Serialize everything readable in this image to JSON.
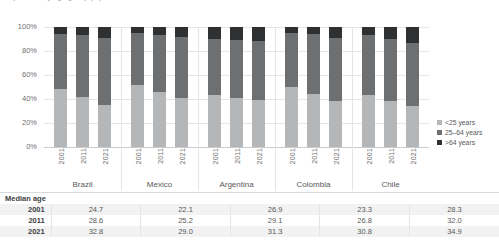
{
  "chart_title": "Population by age group (%)",
  "axis": {
    "y_ticks": [
      "100%",
      "80%",
      "60%",
      "40%",
      "20%",
      "0%"
    ]
  },
  "legend": {
    "items": [
      {
        "label": "<25 years",
        "color": "#b5b6b7",
        "swatch_name": "legend-swatch-under25"
      },
      {
        "label": "25–64 years",
        "color": "#6e6f71",
        "swatch_name": "legend-swatch-25to64"
      },
      {
        "label": ">64 years",
        "color": "#2f3032",
        "swatch_name": "legend-swatch-over64"
      }
    ]
  },
  "countries": [
    {
      "name": "Brazil",
      "years": [
        "2001",
        "2011",
        "2021"
      ]
    },
    {
      "name": "Mexico",
      "years": [
        "2001",
        "2011",
        "2021"
      ]
    },
    {
      "name": "Argentina",
      "years": [
        "2001",
        "2011",
        "2021"
      ]
    },
    {
      "name": "Colombia",
      "years": [
        "2001",
        "2011",
        "2021"
      ]
    },
    {
      "name": "Chile",
      "years": [
        "2001",
        "2011",
        "2021"
      ]
    }
  ],
  "median_age_table": {
    "row_header": "Median age",
    "years": [
      "2001",
      "2011",
      "2021"
    ],
    "rows": [
      {
        "year": "2001",
        "values": [
          "24.7",
          "22.1",
          "26.9",
          "23.3",
          "28.3"
        ]
      },
      {
        "year": "2011",
        "values": [
          "28.6",
          "25.2",
          "29.1",
          "26.8",
          "32.0"
        ]
      },
      {
        "year": "2021",
        "values": [
          "32.8",
          "29.0",
          "31.3",
          "30.8",
          "34.9"
        ]
      }
    ]
  },
  "chart_data": {
    "type": "bar",
    "subtype": "100% stacked column",
    "title": "Population by age group (%)",
    "xlabel": "",
    "ylabel": "",
    "ylim": [
      0,
      100
    ],
    "ytick_labels": [
      "0%",
      "20%",
      "40%",
      "60%",
      "80%",
      "100%"
    ],
    "grid": true,
    "legend_position": "right",
    "categories": [
      "Brazil 2001",
      "Brazil 2011",
      "Brazil 2021",
      "Mexico 2001",
      "Mexico 2011",
      "Mexico 2021",
      "Argentina 2001",
      "Argentina 2011",
      "Argentina 2021",
      "Colombia 2001",
      "Colombia 2011",
      "Colombia 2021",
      "Chile 2001",
      "Chile 2011",
      "Chile 2021"
    ],
    "series": [
      {
        "name": "<25 years",
        "color": "#b5b6b7",
        "values": [
          48,
          42,
          35,
          52,
          46,
          41,
          43,
          41,
          39,
          50,
          44,
          38,
          43,
          38,
          34
        ]
      },
      {
        "name": "25–64 years",
        "color": "#6e6f71",
        "values": [
          46,
          51,
          56,
          43,
          47,
          51,
          47,
          48,
          49,
          45,
          50,
          53,
          50,
          52,
          53
        ]
      },
      {
        "name": ">64 years",
        "color": "#2f3032",
        "values": [
          6,
          7,
          9,
          5,
          7,
          8,
          10,
          11,
          12,
          5,
          6,
          9,
          7,
          10,
          13
        ]
      }
    ],
    "groups": [
      {
        "country": "Brazil",
        "years": [
          "2001",
          "2011",
          "2021"
        ],
        "median_age": [
          24.7,
          28.6,
          32.8
        ]
      },
      {
        "country": "Mexico",
        "years": [
          "2001",
          "2011",
          "2021"
        ],
        "median_age": [
          22.1,
          25.2,
          29.0
        ]
      },
      {
        "country": "Argentina",
        "years": [
          "2001",
          "2011",
          "2021"
        ],
        "median_age": [
          26.9,
          29.1,
          31.3
        ]
      },
      {
        "country": "Colombia",
        "years": [
          "2001",
          "2011",
          "2021"
        ],
        "median_age": [
          23.3,
          26.8,
          30.8
        ]
      },
      {
        "country": "Chile",
        "years": [
          "2001",
          "2011",
          "2021"
        ],
        "median_age": [
          28.3,
          32.0,
          34.9
        ]
      }
    ]
  }
}
